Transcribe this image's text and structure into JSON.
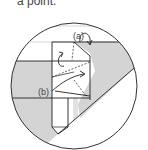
{
  "caption": {
    "text": "a point."
  },
  "diagram": {
    "type": "origami-fold-step",
    "labels": {
      "a": "(a)",
      "b": "(b)"
    },
    "colors": {
      "paper_shade": "#d4d4d4",
      "line": "#222222",
      "circle": "#333333",
      "background": "#ffffff"
    }
  }
}
